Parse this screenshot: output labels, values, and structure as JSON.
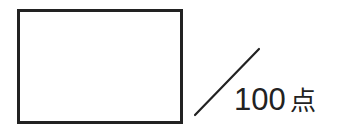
{
  "score_field": {
    "value": "",
    "max_points": "100",
    "unit": "点"
  },
  "colors": {
    "ink": "#222222",
    "background": "#ffffff"
  }
}
